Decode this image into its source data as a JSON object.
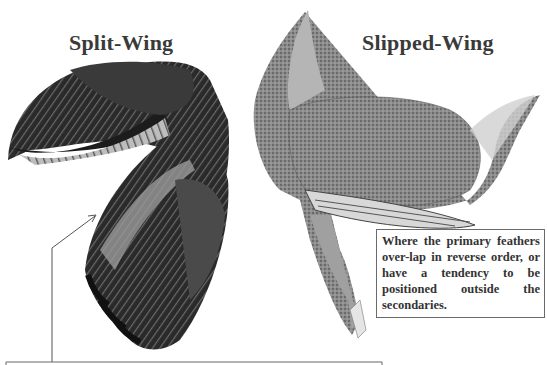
{
  "figure": {
    "left_panel": {
      "title": "Split-Wing",
      "illustration": "split-wing-feathers"
    },
    "right_panel": {
      "title": "Slipped-Wing",
      "illustration": "slipped-wing-bird",
      "caption": "Where the primary feathers over-lap in reverse order, or have a tendency to be positioned outside the secondaries."
    },
    "colors": {
      "text": "#3a3a3a",
      "border": "#6a6a6a",
      "feather_dark": "#1e1e1e",
      "feather_mid": "#5a5a5a",
      "body_gray": "#8a8a8a"
    }
  }
}
